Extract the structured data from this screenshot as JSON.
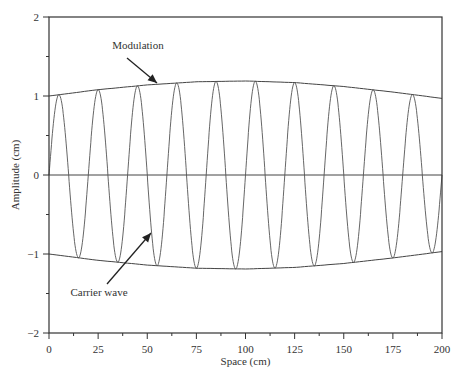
{
  "chart_data": {
    "type": "line",
    "title": "",
    "xlabel": "Space (cm)",
    "ylabel": "Amplitude (cm)",
    "xlim": [
      0,
      200
    ],
    "ylim": [
      -2,
      2
    ],
    "x_ticks": [
      "0",
      "25",
      "50",
      "75",
      "100",
      "125",
      "150",
      "175",
      "200"
    ],
    "y_ticks": [
      "2",
      "1",
      "0",
      "−1",
      "−2"
    ],
    "grid": false,
    "legend": null,
    "series": [
      {
        "name": "Modulation (upper envelope)",
        "x": [
          0,
          25,
          50,
          75,
          100,
          125,
          150,
          175,
          200
        ],
        "values": [
          1.0,
          1.08,
          1.14,
          1.18,
          1.19,
          1.17,
          1.12,
          1.05,
          0.97
        ]
      },
      {
        "name": "Modulation (lower envelope)",
        "x": [
          0,
          25,
          50,
          75,
          100,
          125,
          150,
          175,
          200
        ],
        "values": [
          -1.0,
          -1.08,
          -1.14,
          -1.18,
          -1.19,
          -1.17,
          -1.12,
          -1.05,
          -0.97
        ]
      },
      {
        "name": "Carrier wave",
        "wavelength_cm": 20,
        "cycles": 10,
        "peak_x": [
          5,
          25,
          45,
          65,
          85,
          105,
          125,
          145,
          165,
          185
        ],
        "start_value": 0.3
      },
      {
        "name": "Zero line",
        "x": [
          0,
          200
        ],
        "values": [
          0,
          0
        ]
      }
    ],
    "annotations": [
      {
        "text": "Modulation",
        "x": 25,
        "y": 1.55,
        "arrow_to": [
          45,
          1.13
        ]
      },
      {
        "text": "Carrier wave",
        "x": 15,
        "y": -1.55,
        "arrow_to": [
          40,
          -0.6
        ]
      }
    ]
  },
  "labels": {
    "modulation": "Modulation",
    "carrier": "Carrier wave",
    "xlabel": "Space (cm)",
    "ylabel": "Amplitude (cm)"
  }
}
